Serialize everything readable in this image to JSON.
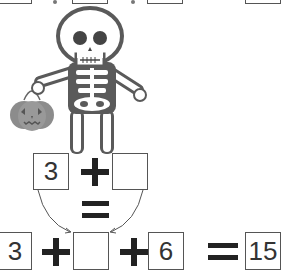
{
  "top_row": {
    "boxes": [
      "",
      "",
      "",
      ""
    ]
  },
  "illustration": {
    "subject": "skeleton holding jack-o-lantern bucket",
    "colors": {
      "outline": "#5a5a5a",
      "pumpkin": "#8c8c8c",
      "bone": "#ffffff"
    }
  },
  "middle_equation": {
    "left_value": "3",
    "operator": "+",
    "right_value": "",
    "result_operator": "="
  },
  "bottom_equation": {
    "term1": "3",
    "op1": "+",
    "term2": "",
    "op2": "+",
    "term3": "6",
    "equals": "=",
    "result": "15"
  }
}
